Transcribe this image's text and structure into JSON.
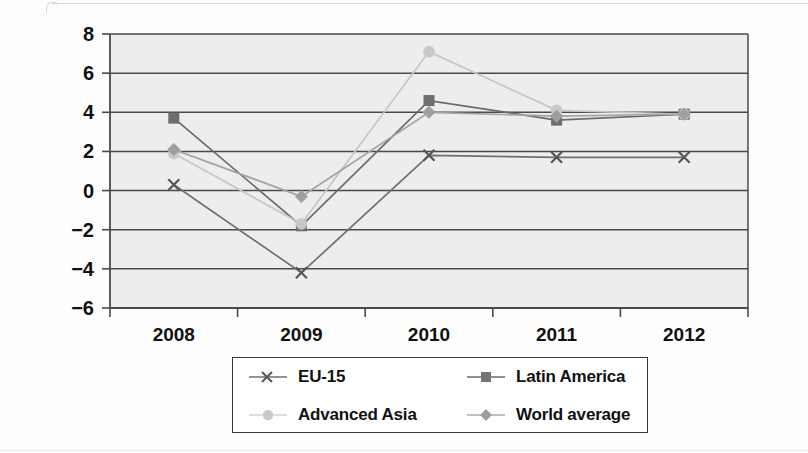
{
  "chart_data": {
    "type": "line",
    "title": "",
    "subtitle": "",
    "xlabel": "",
    "ylabel": "",
    "categories": [
      "2008",
      "2009",
      "2010",
      "2011",
      "2012"
    ],
    "xtick_labels": [
      "2008",
      "2009",
      "2010",
      "2011",
      "2012"
    ],
    "ytick_labels": [
      "8",
      "6",
      "4",
      "2",
      "0",
      "−2",
      "−4",
      "−6"
    ],
    "ytick_values": [
      8,
      6,
      4,
      2,
      0,
      -2,
      -4,
      -6
    ],
    "ylim": [
      -6,
      8
    ],
    "grid": true,
    "grid_axis": "y",
    "legend_position": "below",
    "plot_background": "#ededed",
    "series": [
      {
        "name": "EU-15",
        "marker": "x",
        "color": "#6f6f6f",
        "values": [
          0.3,
          -4.2,
          1.8,
          1.7,
          1.7
        ]
      },
      {
        "name": "Latin America",
        "marker": "square",
        "color": "#6a6a6a",
        "values": [
          3.7,
          -1.8,
          4.6,
          3.6,
          3.9
        ]
      },
      {
        "name": "Advanced Asia",
        "marker": "circle",
        "color": "#c6c6c6",
        "values": [
          1.9,
          -1.7,
          7.1,
          4.1,
          3.9
        ]
      },
      {
        "name": "World average",
        "marker": "diamond",
        "color": "#a3a3a3",
        "values": [
          2.1,
          -0.3,
          4.0,
          3.8,
          3.9
        ]
      }
    ]
  },
  "legend": {
    "items": [
      {
        "label": "EU-15",
        "marker": "x-marker-icon",
        "color": "#6f6f6f"
      },
      {
        "label": "Latin America",
        "marker": "square-marker-icon",
        "color": "#6a6a6a"
      },
      {
        "label": "Advanced Asia",
        "marker": "circle-marker-icon",
        "color": "#c6c6c6"
      },
      {
        "label": "World average",
        "marker": "diamond-marker-icon",
        "color": "#a3a3a3"
      }
    ]
  },
  "axes": {
    "plot_left": 110,
    "plot_right": 748,
    "plot_top": 34,
    "plot_bottom": 308,
    "axis_color": "#4a4a4a"
  }
}
